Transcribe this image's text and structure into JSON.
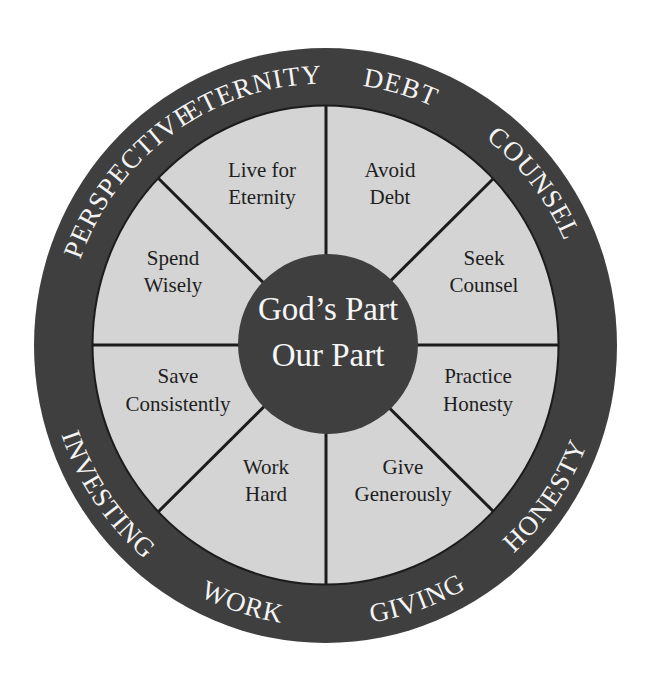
{
  "diagram": {
    "type": "wheel",
    "colors": {
      "outer_ring": "#3f3f3f",
      "sector_fill": "#d4d4d4",
      "divider": "#1c1c1c",
      "hub": "#3f3f3f",
      "ring_text": "#f4f4f4",
      "sector_text": "#1e1e1e",
      "hub_text": "#f6f6f6"
    },
    "hub": {
      "line1": "God’s Part",
      "line2": "Our Part"
    },
    "ring_labels": {
      "perspective": "PERSPECTIVE",
      "eternity": "ETERNITY",
      "debt": "DEBT",
      "counsel": "COUNSEL",
      "honesty": "HONESTY",
      "giving": "GIVING",
      "work": "WORK",
      "investing": "INVESTING"
    },
    "sectors": [
      {
        "line1": "Live for",
        "line2": "Eternity"
      },
      {
        "line1": "Avoid",
        "line2": "Debt"
      },
      {
        "line1": "Seek",
        "line2": "Counsel"
      },
      {
        "line1": "Practice",
        "line2": "Honesty"
      },
      {
        "line1": "Give",
        "line2": "Generously"
      },
      {
        "line1": "Work",
        "line2": "Hard"
      },
      {
        "line1": "Save",
        "line2": "Consistently"
      },
      {
        "line1": "Spend",
        "line2": "Wisely"
      }
    ]
  }
}
